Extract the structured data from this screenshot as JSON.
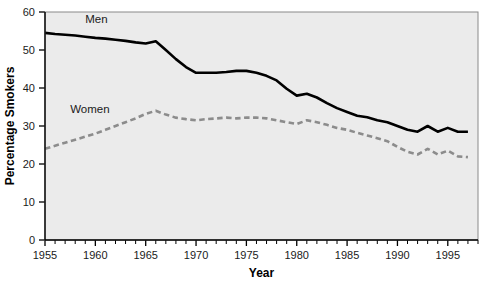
{
  "chart_data": {
    "type": "line",
    "title": "",
    "subtitle": "",
    "xlabel": "Year",
    "ylabel": "Percentage Smokers",
    "xlim": [
      1955,
      1998
    ],
    "ylim": [
      0,
      60
    ],
    "xticks": [
      1955,
      1960,
      1965,
      1970,
      1975,
      1980,
      1985,
      1990,
      1995
    ],
    "xticklabels": [
      "1955",
      "1960",
      "1965",
      "1970",
      "1975",
      "1980",
      "1985",
      "1990",
      "1995"
    ],
    "yticks": [
      0,
      10,
      20,
      30,
      40,
      50,
      60
    ],
    "yticklabels": [
      "0",
      "10",
      "20",
      "30",
      "40",
      "50",
      "60"
    ],
    "minor_xtick_interval": 1,
    "grid": false,
    "legend": "inline-labels",
    "plot_background": "#ebebeb",
    "series": [
      {
        "name": "Men",
        "label": "Men",
        "color": "#000000",
        "linestyle": "solid",
        "linewidth": 2.6,
        "label_x": 1959,
        "label_y": 57,
        "x": [
          1955,
          1956,
          1957,
          1958,
          1959,
          1960,
          1961,
          1962,
          1963,
          1964,
          1965,
          1966,
          1967,
          1968,
          1969,
          1970,
          1971,
          1972,
          1973,
          1974,
          1975,
          1976,
          1977,
          1978,
          1979,
          1980,
          1981,
          1982,
          1983,
          1984,
          1985,
          1986,
          1987,
          1988,
          1989,
          1990,
          1991,
          1992,
          1993,
          1994,
          1995,
          1996,
          1997
        ],
        "values": [
          54.5,
          54.2,
          54.0,
          53.8,
          53.5,
          53.2,
          53.0,
          52.7,
          52.4,
          52.0,
          51.7,
          52.3,
          50.0,
          47.6,
          45.5,
          44.0,
          44.0,
          44.0,
          44.2,
          44.5,
          44.5,
          44.0,
          43.2,
          42.0,
          39.8,
          38.0,
          38.5,
          37.5,
          36.0,
          34.7,
          33.7,
          32.7,
          32.3,
          31.5,
          31.0,
          30.0,
          29.0,
          28.5,
          30.0,
          28.5,
          29.5,
          28.5,
          28.5
        ]
      },
      {
        "name": "Women",
        "label": "Women",
        "color": "#8c8c8c",
        "linestyle": "dashed",
        "linewidth": 2.6,
        "label_x": 1957.5,
        "label_y": 33.5,
        "x": [
          1955,
          1956,
          1957,
          1958,
          1959,
          1960,
          1961,
          1962,
          1963,
          1964,
          1965,
          1966,
          1967,
          1968,
          1969,
          1970,
          1971,
          1972,
          1973,
          1974,
          1975,
          1976,
          1977,
          1978,
          1979,
          1980,
          1981,
          1982,
          1983,
          1984,
          1985,
          1986,
          1987,
          1988,
          1989,
          1990,
          1991,
          1992,
          1993,
          1994,
          1995,
          1996,
          1997
        ],
        "values": [
          24.0,
          24.8,
          25.6,
          26.4,
          27.2,
          28.0,
          29.0,
          30.0,
          31.0,
          32.0,
          33.2,
          34.0,
          33.0,
          32.2,
          31.8,
          31.5,
          31.8,
          32.0,
          32.2,
          32.0,
          32.2,
          32.2,
          32.0,
          31.5,
          31.0,
          30.5,
          31.5,
          31.0,
          30.3,
          29.5,
          29.0,
          28.2,
          27.5,
          26.8,
          26.0,
          24.5,
          23.2,
          22.5,
          24.0,
          22.5,
          23.5,
          22.0,
          21.8
        ]
      }
    ]
  },
  "layout": {
    "plot_left": 45,
    "plot_top": 12,
    "plot_right": 478,
    "plot_bottom": 240
  }
}
